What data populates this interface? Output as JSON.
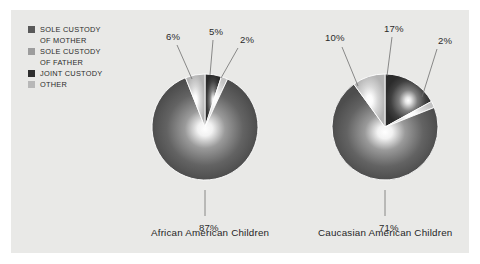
{
  "panel": {
    "background_color": "#e9e9e7",
    "page_background": "#ffffff"
  },
  "legend": {
    "items": [
      {
        "label_line1": "SOLE CUSTODY",
        "label_line2": "OF MOTHER",
        "color": "#595959",
        "key": "sole-custody-of-mother"
      },
      {
        "label_line1": "SOLE CUSTODY",
        "label_line2": "OF FATHER",
        "color": "#9d9d9d",
        "key": "sole-custody-of-father"
      },
      {
        "label_line1": "JOINT CUSTODY",
        "label_line2": "",
        "color": "#2e2e2e",
        "key": "joint-custody"
      },
      {
        "label_line1": "OTHER",
        "label_line2": "",
        "color": "#b8b8b8",
        "key": "other"
      }
    ]
  },
  "chart_data": {
    "type": "pie",
    "title": "",
    "legend_position": "top-left",
    "categories": [
      "SOLE CUSTODY OF MOTHER",
      "SOLE CUSTODY OF FATHER",
      "JOINT CUSTODY",
      "OTHER"
    ],
    "colors": [
      "#595959",
      "#9d9d9d",
      "#2e2e2e",
      "#b8b8b8"
    ],
    "charts": [
      {
        "name": "african-american-children",
        "caption": "African American Children",
        "center": [
          205,
          127
        ],
        "radius": 53,
        "slices": [
          {
            "category": "SOLE CUSTODY OF MOTHER",
            "value": 87,
            "label": "87%",
            "label_pos": [
              199,
              222
            ],
            "leader": [
              [
                205,
                190
              ],
              [
                205,
                216
              ]
            ]
          },
          {
            "category": "SOLE CUSTODY OF FATHER",
            "value": 6,
            "label": "6%",
            "label_pos": [
              166,
              31
            ],
            "leader": [
              [
                192,
                79
              ],
              [
                177,
                45
              ]
            ]
          },
          {
            "category": "JOINT CUSTODY",
            "value": 5,
            "label": "5%",
            "label_pos": [
              209,
              26
            ],
            "leader": [
              [
                210,
                75
              ],
              [
                213,
                40
              ]
            ]
          },
          {
            "category": "OTHER",
            "value": 2,
            "label": "2%",
            "label_pos": [
              240,
              34
            ],
            "leader": [
              [
                221,
                78
              ],
              [
                238,
                48
              ]
            ]
          }
        ]
      },
      {
        "name": "caucasian-american-children",
        "caption": "Caucasian American Children",
        "center": [
          385,
          127
        ],
        "radius": 53,
        "slices": [
          {
            "category": "SOLE CUSTODY OF MOTHER",
            "value": 71,
            "label": "71%",
            "label_pos": [
              379,
              222
            ],
            "leader": [
              [
                385,
                190
              ],
              [
                385,
                216
              ]
            ]
          },
          {
            "category": "SOLE CUSTODY OF FATHER",
            "value": 10,
            "label": "10%",
            "label_pos": [
              325,
              32
            ],
            "leader": [
              [
                358,
                86
              ],
              [
                342,
                47
              ]
            ]
          },
          {
            "category": "JOINT CUSTODY",
            "value": 17,
            "label": "17%",
            "label_pos": [
              384,
              23
            ],
            "leader": [
              [
                387,
                76
              ],
              [
                392,
                37
              ]
            ]
          },
          {
            "category": "OTHER",
            "value": 2,
            "label": "2%",
            "label_pos": [
              438,
              35
            ],
            "leader": [
              [
                422,
                97
              ],
              [
                437,
                49
              ]
            ]
          }
        ]
      }
    ]
  },
  "captions": {
    "left": "African American Children",
    "right": "Caucasian American Children",
    "left_pos": [
      151,
      232
    ],
    "right_pos": [
      318,
      232
    ]
  }
}
